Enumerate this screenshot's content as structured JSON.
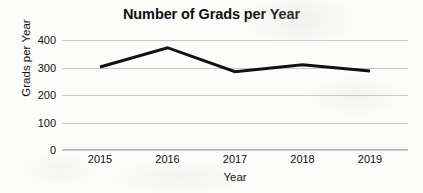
{
  "chart_data": {
    "type": "line",
    "title": "Number of Grads per Year",
    "xlabel": "Year",
    "ylabel": "Grads per Year",
    "categories": [
      "2015",
      "2016",
      "2017",
      "2018",
      "2019"
    ],
    "values": [
      302,
      372,
      285,
      310,
      287
    ],
    "series": [
      {
        "name": "Grads per Year",
        "values": [
          302,
          372,
          285,
          310,
          287
        ],
        "color": "#111111"
      }
    ],
    "ylim": [
      0,
      400
    ],
    "yticks": [
      "0",
      "100",
      "200",
      "300",
      "400"
    ],
    "ytick_values": [
      0,
      100,
      200,
      300,
      400
    ],
    "xticks": [
      "2015",
      "2016",
      "2017",
      "2018",
      "2019"
    ],
    "grid": true,
    "grid_color": "#c9c9c9",
    "legend": "none",
    "line_color": "#111111",
    "line_width": 3,
    "background": "#fcfcfb"
  }
}
